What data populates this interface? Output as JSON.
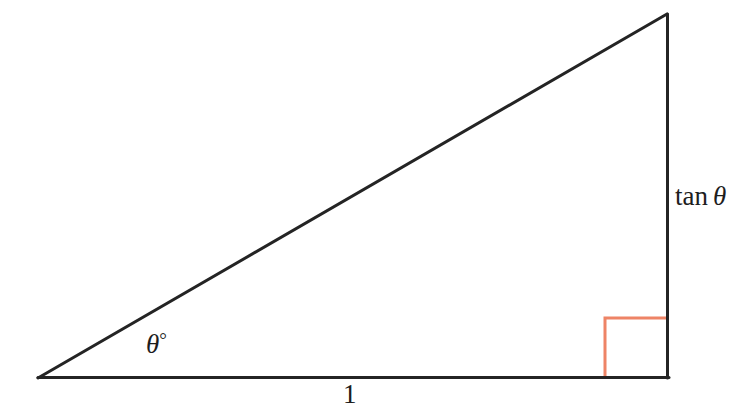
{
  "figure": {
    "kind": "right-triangle-trigonometry-diagram",
    "background_color": "#ffffff",
    "width": 755,
    "height": 415,
    "stroke_color": "#242424",
    "stroke_width": 3,
    "right_angle_marker_color": "#ee8466",
    "right_angle_marker_width": 3,
    "right_angle_marker_size": 62,
    "vertices": {
      "angle_vertex": {
        "x": 38,
        "y": 378
      },
      "right_angle_vertex": {
        "x": 668,
        "y": 378
      },
      "apex": {
        "x": 667,
        "y": 14
      }
    },
    "sides": [
      {
        "name": "adjacent-base",
        "from": "angle_vertex",
        "to": "right_angle_vertex",
        "label": "1"
      },
      {
        "name": "opposite-vertical",
        "from": "right_angle_vertex",
        "to": "apex",
        "label": "tan θ"
      },
      {
        "name": "hypotenuse",
        "from": "angle_vertex",
        "to": "apex",
        "label": ""
      }
    ]
  },
  "labels": {
    "angle": {
      "theta": "θ",
      "degree": "°",
      "full": "θ°"
    },
    "base": {
      "text": "1"
    },
    "opposite": {
      "function": "tan",
      "theta": "θ",
      "full": "tan θ"
    }
  }
}
